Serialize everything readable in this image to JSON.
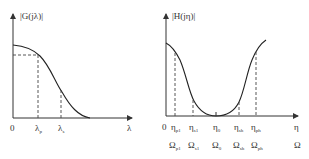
{
  "left_plot": {
    "ylabel": "|G(jλ)|",
    "xlabel": "λ",
    "origin": "0",
    "ticks": [
      {
        "main": "λ",
        "sub": "p"
      },
      {
        "main": "λ",
        "sub": "s"
      }
    ]
  },
  "right_plot": {
    "ylabel": "|H(jη)|",
    "xlabel": "η",
    "xlabel2": "Ω",
    "origin": "0",
    "ticks_eta": [
      {
        "main": "η",
        "sub": "p1"
      },
      {
        "main": "η",
        "sub": "s1"
      },
      {
        "main": "η",
        "sub": "0"
      },
      {
        "main": "η",
        "sub": "sh"
      },
      {
        "main": "η",
        "sub": "ph"
      }
    ],
    "ticks_omega": [
      {
        "main": "Ω",
        "sub": "p1"
      },
      {
        "main": "Ω",
        "sub": "s1"
      },
      {
        "main": "Ω",
        "sub": "0"
      },
      {
        "main": "Ω",
        "sub": "sh"
      },
      {
        "main": "Ω",
        "sub": "ph"
      }
    ]
  },
  "colors": {
    "line": "#222222",
    "background": "#ffffff"
  }
}
